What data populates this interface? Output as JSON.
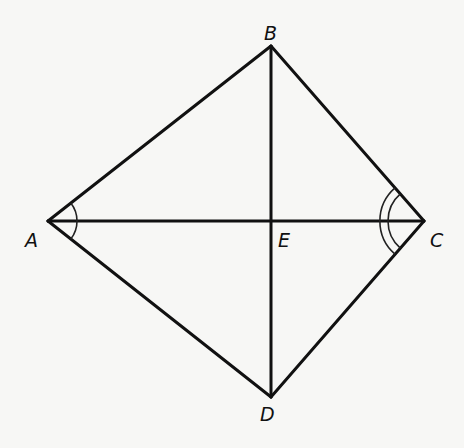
{
  "diagram": {
    "type": "geometry-kite",
    "points": {
      "A": {
        "label": "A",
        "x": 48,
        "y": 221
      },
      "B": {
        "label": "B",
        "x": 271,
        "y": 46
      },
      "C": {
        "label": "C",
        "x": 424,
        "y": 221
      },
      "D": {
        "label": "D",
        "x": 271,
        "y": 397
      },
      "E": {
        "label": "E",
        "x": 271,
        "y": 221
      }
    },
    "segments": [
      "AB",
      "BC",
      "CD",
      "DA",
      "AC",
      "BD"
    ],
    "angle_marks": [
      {
        "vertex": "A",
        "angles": [
          "BAE",
          "EAD"
        ],
        "arcs": 1
      },
      {
        "vertex": "C",
        "angles": [
          "BCE",
          "ECD"
        ],
        "arcs": 2
      }
    ],
    "colors": {
      "line": "#111111",
      "background": "#f7f7f5"
    }
  }
}
